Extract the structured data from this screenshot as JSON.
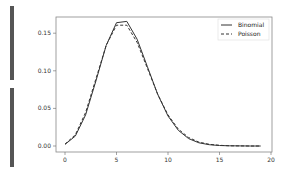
{
  "chart_data": {
    "type": "line",
    "title": "",
    "xlabel": "",
    "ylabel": "",
    "xlim": [
      -1,
      20
    ],
    "ylim": [
      -0.008,
      0.172
    ],
    "xticks": [
      0,
      5,
      10,
      15,
      20
    ],
    "yticks": [
      "0.00",
      "0.05",
      "0.10",
      "0.15"
    ],
    "grid": false,
    "legend_position": "upper right",
    "x": [
      0,
      1,
      2,
      3,
      4,
      5,
      6,
      7,
      8,
      9,
      10,
      11,
      12,
      13,
      14,
      15,
      16,
      17,
      18,
      19
    ],
    "series": [
      {
        "name": "Binomial",
        "style": "solid",
        "values": [
          0.0021,
          0.0131,
          0.0414,
          0.0864,
          0.1338,
          0.1639,
          0.1657,
          0.142,
          0.1054,
          0.0687,
          0.0399,
          0.0209,
          0.0099,
          0.0043,
          0.0017,
          0.0006,
          0.0002,
          0.0001,
          0.0,
          0.0
        ]
      },
      {
        "name": "Poisson",
        "style": "dashed",
        "values": [
          0.0025,
          0.0149,
          0.0446,
          0.0892,
          0.1339,
          0.1606,
          0.1606,
          0.1377,
          0.1033,
          0.0688,
          0.0413,
          0.0225,
          0.0113,
          0.0052,
          0.0022,
          0.0009,
          0.0003,
          0.0001,
          0.0,
          0.0
        ]
      }
    ]
  },
  "legend": {
    "binomial": "Binomial",
    "poisson": "Poisson"
  },
  "ticks": {
    "x": [
      "0",
      "5",
      "10",
      "15",
      "20"
    ],
    "y": [
      "0.00",
      "0.05",
      "0.10",
      "0.15"
    ]
  }
}
